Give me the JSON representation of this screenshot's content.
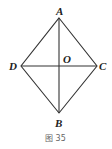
{
  "figure": {
    "caption": "图 35",
    "points": {
      "A": {
        "label": "A",
        "x": 59,
        "y": 18
      },
      "B": {
        "label": "B",
        "x": 59,
        "y": 113
      },
      "C": {
        "label": "C",
        "x": 97,
        "y": 66
      },
      "D": {
        "label": "D",
        "x": 21,
        "y": 66
      },
      "O": {
        "label": "O",
        "x": 59,
        "y": 66
      }
    },
    "segments": [
      [
        "A",
        "C"
      ],
      [
        "C",
        "B"
      ],
      [
        "B",
        "D"
      ],
      [
        "D",
        "A"
      ],
      [
        "A",
        "B"
      ],
      [
        "D",
        "C"
      ]
    ],
    "stroke_color": "#333333"
  }
}
